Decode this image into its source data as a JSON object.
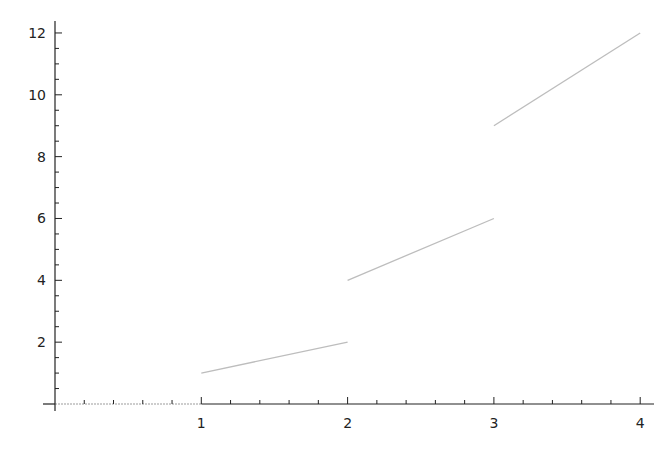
{
  "chart_data": {
    "type": "line",
    "title": "",
    "xlabel": "",
    "ylabel": "",
    "xlim": [
      0,
      4.1
    ],
    "ylim": [
      -0.2,
      12.5
    ],
    "grid": false,
    "legend": null,
    "x_ticks": [
      1,
      2,
      3,
      4
    ],
    "x_tick_labels": [
      "1",
      "2",
      "3",
      "4"
    ],
    "y_ticks": [
      2,
      4,
      6,
      8,
      10,
      12
    ],
    "y_tick_labels": [
      "2",
      "4",
      "6",
      "8",
      "10",
      "12"
    ],
    "x_minor_step": 0.2,
    "y_minor_step": 0.5,
    "line_color": "#bdbdbd",
    "axis_color": "#222222",
    "series": [
      {
        "name": "piecewise",
        "segments": [
          {
            "x": [
              0,
              1
            ],
            "y": [
              0,
              0
            ]
          },
          {
            "x": [
              1,
              2
            ],
            "y": [
              1,
              2
            ]
          },
          {
            "x": [
              2,
              3
            ],
            "y": [
              4,
              6
            ]
          },
          {
            "x": [
              3,
              4
            ],
            "y": [
              9,
              12
            ]
          }
        ]
      }
    ]
  }
}
